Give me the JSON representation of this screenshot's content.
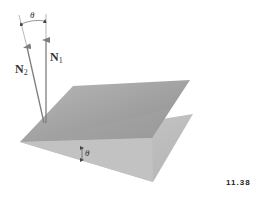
{
  "figure": {
    "number": "11.38"
  },
  "labels": {
    "n1": {
      "symbol": "N",
      "subscript": "1"
    },
    "n2": {
      "symbol": "N",
      "subscript": "2"
    },
    "theta_top": "θ",
    "theta_planes": "θ"
  },
  "colors": {
    "upper_plane": "#a9a9a9",
    "upper_plane_dark": "#8f8f8f",
    "lower_plane": "#c4c4c4",
    "arrow": "#7d7d7d",
    "text": "#333333"
  }
}
